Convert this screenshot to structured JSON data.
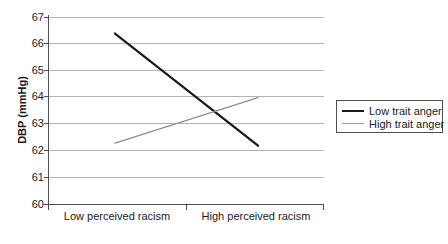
{
  "chart_data": {
    "type": "line",
    "title": "",
    "xlabel": "",
    "ylabel": "DBP (mmHg)",
    "categories": [
      "Low perceived racism",
      "High perceived racism"
    ],
    "series": [
      {
        "name": "Low trait anger",
        "values": [
          66.4,
          62.2
        ],
        "color": "#1a1a1a",
        "width": 2
      },
      {
        "name": "High trait anger",
        "values": [
          62.3,
          64.0
        ],
        "color": "#9a9a9a",
        "width": 1
      }
    ],
    "ylim": [
      60,
      67
    ],
    "yticks": [
      60,
      61,
      62,
      63,
      64,
      65,
      66,
      67
    ],
    "ytick_labels": [
      "60",
      "61",
      "62",
      "63",
      "64",
      "65",
      "66",
      "67"
    ],
    "grid": true,
    "grid_axis": "y",
    "legend_position": "right-outside"
  },
  "axis": {
    "y_title": "DBP (mmHg)",
    "y_tick_labels": [
      "67",
      "66",
      "65",
      "64",
      "63",
      "62",
      "61",
      "60"
    ],
    "x_tick_labels": [
      "Low perceived racism",
      "High perceived racism"
    ]
  },
  "legend": {
    "entries": [
      {
        "label": "Low trait anger"
      },
      {
        "label": "High trait anger"
      }
    ]
  }
}
